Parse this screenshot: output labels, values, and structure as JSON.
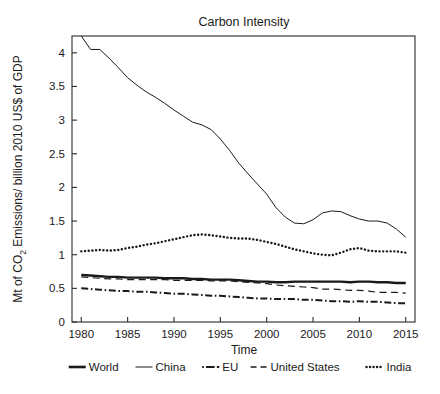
{
  "chart_data": {
    "type": "line",
    "title": "Carbon Intensity",
    "xlabel": "Time",
    "ylabel": "Mt of CO2 Emissions/ billion 2010 US$ of GDP",
    "ylabel_parts": {
      "pre": "Mt of CO",
      "sub": "2",
      "post": " Emissions/ billion 2010 US$ of GDP"
    },
    "xlim": [
      1979,
      2016
    ],
    "ylim": [
      0,
      4.25
    ],
    "xticks": [
      1980,
      1985,
      1990,
      1995,
      2000,
      2005,
      2010,
      2015
    ],
    "xticklabels": [
      "1980",
      "1985",
      "1990",
      "1995",
      "2000",
      "2005",
      "2010",
      "2015"
    ],
    "yticks": [
      0,
      0.5,
      1,
      1.5,
      2,
      2.5,
      3,
      3.5,
      4
    ],
    "yticklabels": [
      "0",
      "0.5",
      "1",
      "1.5",
      "2",
      "2.5",
      "3",
      "3.5",
      "4"
    ],
    "grid": false,
    "legend_position": "bottom",
    "x": [
      1980,
      1981,
      1982,
      1983,
      1984,
      1985,
      1986,
      1987,
      1988,
      1989,
      1990,
      1991,
      1992,
      1993,
      1994,
      1995,
      1996,
      1997,
      1998,
      1999,
      2000,
      2001,
      2002,
      2003,
      2004,
      2005,
      2006,
      2007,
      2008,
      2009,
      2010,
      2011,
      2012,
      2013,
      2014,
      2015
    ],
    "series": [
      {
        "name": "World",
        "style": "solid-thick",
        "values": [
          0.7,
          0.69,
          0.68,
          0.67,
          0.67,
          0.66,
          0.66,
          0.66,
          0.66,
          0.65,
          0.65,
          0.65,
          0.64,
          0.64,
          0.63,
          0.63,
          0.63,
          0.62,
          0.61,
          0.6,
          0.6,
          0.59,
          0.59,
          0.6,
          0.6,
          0.6,
          0.6,
          0.6,
          0.6,
          0.59,
          0.6,
          0.6,
          0.59,
          0.59,
          0.58,
          0.58
        ]
      },
      {
        "name": "China",
        "style": "solid-thin",
        "values": [
          4.25,
          4.05,
          4.05,
          3.92,
          3.78,
          3.63,
          3.52,
          3.42,
          3.34,
          3.25,
          3.15,
          3.06,
          2.97,
          2.93,
          2.86,
          2.72,
          2.55,
          2.36,
          2.2,
          2.05,
          1.9,
          1.7,
          1.56,
          1.47,
          1.46,
          1.52,
          1.62,
          1.65,
          1.64,
          1.58,
          1.53,
          1.5,
          1.5,
          1.47,
          1.38,
          1.26
        ]
      },
      {
        "name": "EU",
        "style": "dash-dot",
        "values": [
          0.5,
          0.49,
          0.48,
          0.47,
          0.46,
          0.46,
          0.45,
          0.45,
          0.44,
          0.43,
          0.42,
          0.42,
          0.41,
          0.4,
          0.39,
          0.39,
          0.38,
          0.37,
          0.36,
          0.35,
          0.35,
          0.34,
          0.34,
          0.34,
          0.33,
          0.33,
          0.32,
          0.31,
          0.31,
          0.3,
          0.31,
          0.3,
          0.3,
          0.29,
          0.28,
          0.28
        ]
      },
      {
        "name": "United States",
        "style": "dashed",
        "values": [
          0.67,
          0.66,
          0.65,
          0.64,
          0.64,
          0.63,
          0.63,
          0.63,
          0.63,
          0.63,
          0.62,
          0.62,
          0.62,
          0.62,
          0.61,
          0.61,
          0.61,
          0.6,
          0.59,
          0.58,
          0.57,
          0.55,
          0.54,
          0.53,
          0.52,
          0.51,
          0.49,
          0.49,
          0.48,
          0.47,
          0.47,
          0.46,
          0.44,
          0.44,
          0.44,
          0.43
        ]
      },
      {
        "name": "India",
        "style": "dotted",
        "values": [
          1.05,
          1.06,
          1.07,
          1.06,
          1.07,
          1.1,
          1.12,
          1.15,
          1.17,
          1.2,
          1.23,
          1.26,
          1.29,
          1.3,
          1.29,
          1.27,
          1.25,
          1.24,
          1.24,
          1.22,
          1.19,
          1.16,
          1.12,
          1.08,
          1.05,
          1.02,
          1.0,
          0.99,
          1.03,
          1.08,
          1.1,
          1.06,
          1.05,
          1.05,
          1.05,
          1.03
        ]
      }
    ]
  },
  "legend": {
    "items": [
      {
        "label": "World"
      },
      {
        "label": "China"
      },
      {
        "label": "EU"
      },
      {
        "label": "United States"
      },
      {
        "label": "India"
      }
    ]
  }
}
